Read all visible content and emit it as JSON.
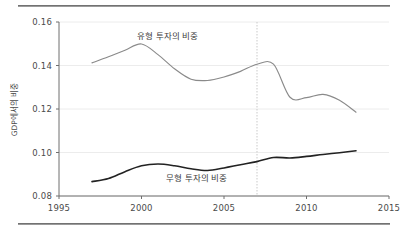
{
  "figure": {
    "background_color": "#ffffff",
    "rule_color": "#5c5c5c"
  },
  "axes": {
    "y_label": "GDP에서의 비중",
    "y_ticks": [
      "0.16",
      "0.14",
      "0.12",
      "0.10",
      "0.08"
    ],
    "x_ticks": [
      "1995",
      "2000",
      "2005",
      "2010",
      "2015"
    ]
  },
  "annotations": {
    "tangible_label": "유형 투자의 비중",
    "intangible_label": "무형 투자의 비중"
  },
  "chart_data": {
    "type": "line",
    "title": "",
    "xlabel": "",
    "ylabel": "GDP에서의 비중",
    "xlim": [
      1995,
      2015
    ],
    "ylim": [
      0.08,
      0.16
    ],
    "xticks": [
      1995,
      2000,
      2005,
      2010,
      2015
    ],
    "yticks": [
      0.08,
      0.1,
      0.12,
      0.14,
      0.16
    ],
    "grid": "horizontal-light",
    "legend": "inline-annotations",
    "vertical_reference_line": {
      "x": 2007,
      "style": "dotted",
      "color": "#c9c9c9"
    },
    "x": [
      1997,
      1998,
      1999,
      2000,
      2001,
      2002,
      2003,
      2004,
      2005,
      2006,
      2007,
      2008,
      2009,
      2010,
      2011,
      2012,
      2013
    ],
    "series": [
      {
        "name": "유형 투자의 비중",
        "color": "#8a8a8a",
        "values": [
          0.1412,
          0.144,
          0.147,
          0.1499,
          0.145,
          0.1385,
          0.1337,
          0.1331,
          0.1347,
          0.1373,
          0.1406,
          0.1406,
          0.1254,
          0.1252,
          0.1267,
          0.124,
          0.1185
        ]
      },
      {
        "name": "무형 투자의 비중",
        "color": "#222222",
        "values": [
          0.0866,
          0.088,
          0.0912,
          0.0939,
          0.0947,
          0.0939,
          0.0925,
          0.0917,
          0.0929,
          0.0944,
          0.0958,
          0.0977,
          0.0975,
          0.0982,
          0.0991,
          0.0999,
          0.1008
        ]
      }
    ]
  }
}
